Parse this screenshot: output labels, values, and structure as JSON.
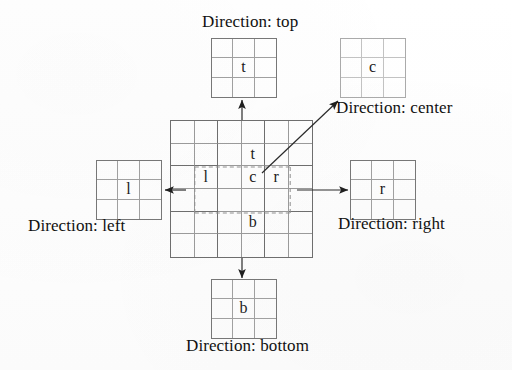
{
  "figure": {
    "title_present": false,
    "background_color": "#fefefe",
    "line_color": "#6e6e6e",
    "text_color": "#111111"
  },
  "main_grid": {
    "name": "main-grid",
    "rows": 6,
    "columns": 6,
    "cell_labels": {
      "top": "t",
      "center": "c",
      "left": "l",
      "right": "r",
      "bottom": "b"
    },
    "dashed_region": {
      "label": "inner-3x3-dashed-region",
      "start_col": 2,
      "end_col": 4,
      "start_row": 2,
      "end_row": 4,
      "style": "dashed"
    }
  },
  "patches": [
    {
      "id": "top",
      "name": "patch-top",
      "glyph": "t",
      "rows": 3,
      "columns": 3,
      "label": "Direction: top",
      "arrow": "up"
    },
    {
      "id": "center",
      "name": "patch-center",
      "glyph": "c",
      "rows": 3,
      "columns": 3,
      "label": "Direction: center",
      "arrow": "diagonal-up-right"
    },
    {
      "id": "left",
      "name": "patch-left",
      "glyph": "l",
      "rows": 3,
      "columns": 3,
      "label": "Direction: left",
      "arrow": "left"
    },
    {
      "id": "right",
      "name": "patch-right",
      "glyph": "r",
      "rows": 3,
      "columns": 3,
      "label": "Direction: right",
      "arrow": "right"
    },
    {
      "id": "bottom",
      "name": "patch-bottom",
      "glyph": "b",
      "rows": 3,
      "columns": 3,
      "label": "Direction: bottom",
      "arrow": "down"
    }
  ],
  "labels": {
    "top": "Direction: top",
    "center": "Direction: center",
    "left": "Direction: left",
    "right": "Direction: right",
    "bottom": "Direction: bottom"
  }
}
